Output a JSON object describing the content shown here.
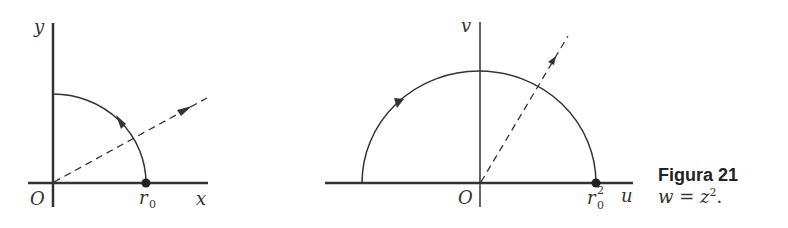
{
  "figure": {
    "caption_title": "Figura 21",
    "caption_eq_w": "w",
    "caption_eq_eq": " = ",
    "caption_eq_z": "z",
    "caption_eq_exp": "2",
    "caption_eq_end": "."
  },
  "left_plot": {
    "x_label": "x",
    "y_label": "y",
    "origin_label": "O",
    "point_label": "r",
    "point_sub": "0"
  },
  "right_plot": {
    "u_label": "u",
    "v_label": "v",
    "origin_label": "O",
    "point_label": "r",
    "point_sub": "0",
    "point_sup": "2"
  },
  "colors": {
    "stroke": "#333333"
  }
}
